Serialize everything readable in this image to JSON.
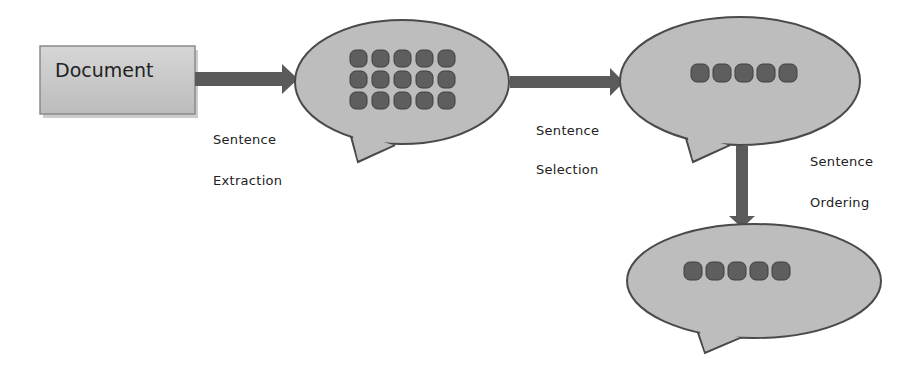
{
  "diagram": {
    "document_box": {
      "label": "Document"
    },
    "steps": [
      {
        "line1": "Sentence",
        "line2": "Extraction"
      },
      {
        "line1": "Sentence",
        "line2": "Selection"
      },
      {
        "line1": "Sentence",
        "line2": "Ordering"
      }
    ],
    "bubbles": [
      {
        "name": "extracted-sentences",
        "dot_rows": 3,
        "dot_cols": 5
      },
      {
        "name": "selected-sentences",
        "dot_rows": 1,
        "dot_cols": 5
      },
      {
        "name": "ordered-sentences",
        "dot_rows": 1,
        "dot_cols": 5
      }
    ],
    "colors": {
      "bubble_fill": "#bdbdbd",
      "bubble_stroke": "#4a4a4a",
      "dot_fill": "#5e5e5e",
      "arrow": "#5a5a5a",
      "doc_fill": "#c8c8c8"
    }
  }
}
